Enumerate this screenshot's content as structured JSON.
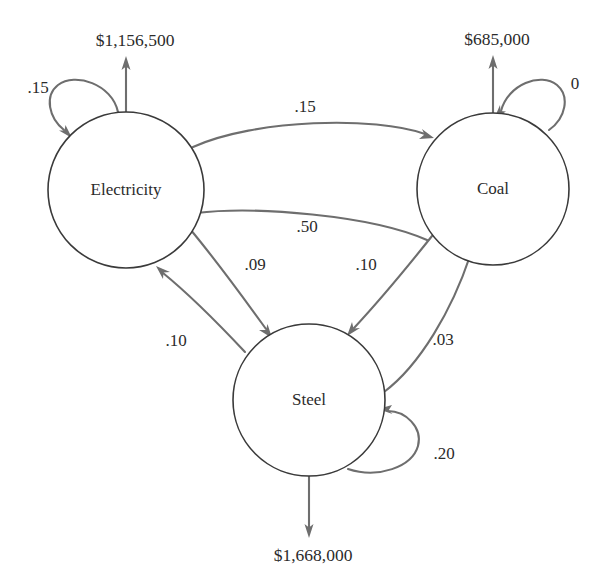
{
  "diagram": {
    "type": "directed-graph",
    "background_color": "#ffffff",
    "node_stroke_color": "#3a3a3a",
    "edge_color": "#6e6e6e",
    "text_color": "#2b2b2b"
  },
  "nodes": [
    {
      "id": "electricity",
      "label": "Electricity",
      "cx": 126,
      "cy": 190,
      "r": 78,
      "self_loop_value": ".15",
      "output_value": "$1,156,500",
      "output_direction": "up"
    },
    {
      "id": "coal",
      "label": "Coal",
      "cx": 493,
      "cy": 189,
      "r": 76,
      "self_loop_value": "0",
      "output_value": "$685,000",
      "output_direction": "up"
    },
    {
      "id": "steel",
      "label": "Steel",
      "cx": 309,
      "cy": 400,
      "r": 76,
      "self_loop_value": ".20",
      "output_value": "$1,668,000",
      "output_direction": "down"
    }
  ],
  "edges": [
    {
      "id": "electricity-to-coal",
      "from": "Electricity",
      "to": "Coal",
      "value": ".15",
      "label_x": 305,
      "label_y": 108
    },
    {
      "id": "coal-to-electricity",
      "from": "Coal",
      "to": "Electricity",
      "value": ".50",
      "label_x": 307,
      "label_y": 228
    },
    {
      "id": "electricity-to-steel",
      "from": "Electricity",
      "to": "Steel",
      "value": ".09",
      "label_x": 255,
      "label_y": 266
    },
    {
      "id": "steel-to-electricity",
      "from": "Steel",
      "to": "Electricity",
      "value": ".10",
      "label_x": 176,
      "label_y": 342
    },
    {
      "id": "coal-to-steel",
      "from": "Coal",
      "to": "Steel",
      "value": ".10",
      "label_x": 366,
      "label_y": 266
    },
    {
      "id": "steel-to-coal",
      "from": "Steel",
      "to": "Coal",
      "value": ".03",
      "label_x": 443,
      "label_y": 341
    }
  ],
  "loop_labels": [
    {
      "id": "electricity-loop-label",
      "value": ".15",
      "x": 38,
      "y": 89
    },
    {
      "id": "coal-loop-label",
      "value": "0",
      "x": 575,
      "y": 85
    },
    {
      "id": "steel-loop-label",
      "value": ".20",
      "x": 444,
      "y": 455
    }
  ],
  "io_labels": [
    {
      "id": "electricity-output-label",
      "value": "$1,156,500",
      "x": 135,
      "y": 42
    },
    {
      "id": "coal-output-label",
      "value": "$685,000",
      "x": 497,
      "y": 41
    },
    {
      "id": "steel-output-label",
      "value": "$1,668,000",
      "x": 313,
      "y": 557
    }
  ]
}
